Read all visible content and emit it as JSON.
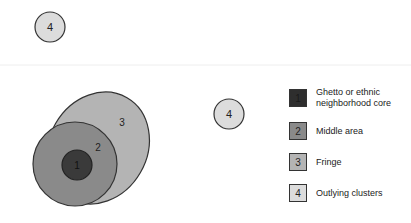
{
  "diagram": {
    "regions": [
      {
        "id": "1",
        "label": "1",
        "name": "Ghetto or ethnic neighborhood core",
        "color": "#3a3a3a"
      },
      {
        "id": "2",
        "label": "2",
        "name": "Middle area",
        "color": "#8a8a8a"
      },
      {
        "id": "3",
        "label": "3",
        "name": "Fringe",
        "color": "#b4b4b4"
      },
      {
        "id": "4",
        "label": "4",
        "name": "Outlying clusters",
        "color": "#dcdcdc"
      }
    ],
    "outlying_labels": [
      "4",
      "4"
    ]
  },
  "legend": {
    "items": [
      {
        "number": "1",
        "label_line1": "Ghetto or ethnic",
        "label_line2": "neighborhood core"
      },
      {
        "number": "2",
        "label_line1": "Middle area",
        "label_line2": ""
      },
      {
        "number": "3",
        "label_line1": "Fringe",
        "label_line2": ""
      },
      {
        "number": "4",
        "label_line1": "Outlying clusters",
        "label_line2": ""
      }
    ]
  }
}
